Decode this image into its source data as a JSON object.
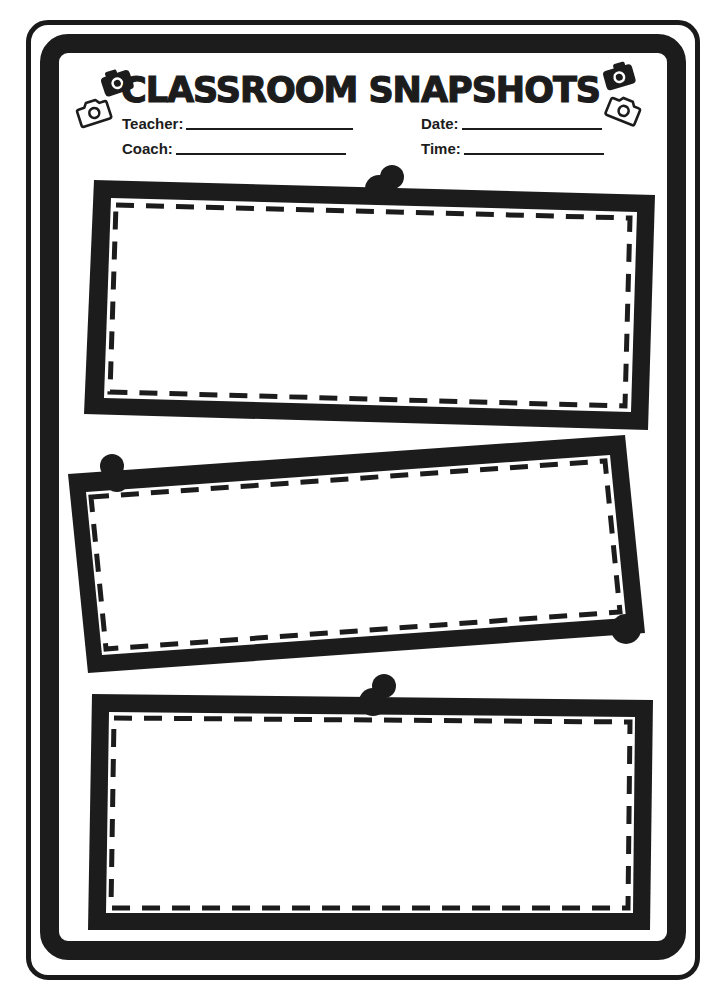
{
  "document": {
    "title": "CLASSROOM SNAPSHOTS",
    "fields": {
      "teacher": {
        "label": "Teacher:",
        "value": ""
      },
      "coach": {
        "label": "Coach:",
        "value": ""
      },
      "date": {
        "label": "Date:",
        "value": ""
      },
      "time": {
        "label": "Time:",
        "value": ""
      }
    },
    "icons": [
      "camera-icon-filled",
      "camera-icon-outline",
      "camera-icon-filled",
      "camera-icon-outline"
    ],
    "snapshot_frames": [
      {
        "id": 1,
        "content": "",
        "tilt": "slight-clockwise",
        "pin": "top-center"
      },
      {
        "id": 2,
        "content": "",
        "tilt": "counter-clockwise",
        "pin": "top-left and bottom-right"
      },
      {
        "id": 3,
        "content": "",
        "tilt": "slight",
        "pin": "top-center"
      }
    ],
    "colors": {
      "ink": "#1c1c1c",
      "paper": "#ffffff"
    }
  }
}
